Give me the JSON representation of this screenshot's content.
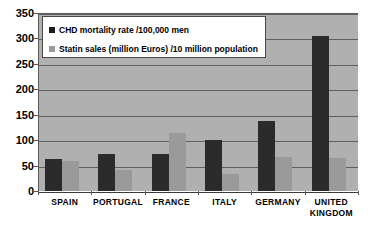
{
  "chart_data": {
    "type": "bar",
    "title": "",
    "subtitle": "",
    "xlabel": "",
    "ylabel": "",
    "ylim": [
      0,
      350
    ],
    "yticks": [
      0,
      50,
      100,
      150,
      200,
      250,
      300,
      350
    ],
    "ytick_labels": [
      "0",
      "50",
      "100",
      "150",
      "200",
      "250",
      "300",
      "350"
    ],
    "grid": true,
    "legend_position": "upper-left-inside",
    "categories": [
      "SPAIN",
      "PORTUGAL",
      "FRANCE",
      "ITALY",
      "GERMANY",
      "UNITED KINGDOM"
    ],
    "category_lines": [
      [
        "SPAIN"
      ],
      [
        "PORTUGAL"
      ],
      [
        "FRANCE"
      ],
      [
        "ITALY"
      ],
      [
        "GERMANY"
      ],
      [
        "UNITED",
        "KINGDOM"
      ]
    ],
    "series": [
      {
        "name": "CHD mortality rate /100,000 men",
        "color": "#2b2b2b",
        "values": [
          62,
          72,
          72,
          101,
          138,
          305
        ]
      },
      {
        "name": "Statin sales (million Euros) /10 million population",
        "color": "#9a9a9a",
        "values": [
          60,
          42,
          114,
          33,
          67,
          65
        ]
      }
    ]
  },
  "legend": {
    "items": [
      {
        "label": "CHD mortality rate /100,000 men",
        "swatch": "series-0"
      },
      {
        "label": "Statin sales (million Euros) /10 million population",
        "swatch": "series-1"
      }
    ]
  },
  "colors": {
    "series_0": "#2b2b2b",
    "series_1": "#9a9a9a",
    "plot_background": "#b0b0b0",
    "gridline": "#606060",
    "axis": "#5a5a5a",
    "legend_background": "#ffffff",
    "text": "#000000"
  }
}
